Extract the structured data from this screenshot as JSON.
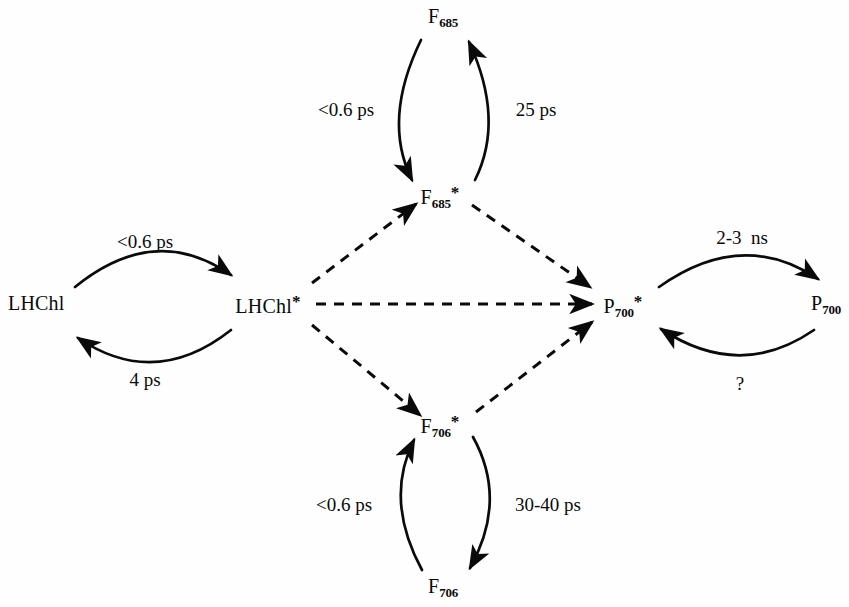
{
  "diagram": {
    "type": "state-transition-diagram",
    "background_color": "#fefefe",
    "line_color": "#0a0a0a",
    "nodes": [
      {
        "id": "lhchl",
        "base": "LHChl",
        "sub": "",
        "star": false,
        "x": 42,
        "y": 305,
        "align": "left"
      },
      {
        "id": "lhchl-star",
        "base": "LHChl",
        "sub": "",
        "star": true,
        "x": 268,
        "y": 305,
        "align": "center"
      },
      {
        "id": "f685",
        "base": "F",
        "sub": "685",
        "star": false,
        "x": 443,
        "y": 18,
        "align": "center"
      },
      {
        "id": "f685-star",
        "base": "F",
        "sub": "685",
        "star": true,
        "x": 440,
        "y": 196,
        "align": "center"
      },
      {
        "id": "f706-star",
        "base": "F",
        "sub": "706",
        "star": true,
        "x": 440,
        "y": 425,
        "align": "center"
      },
      {
        "id": "f706",
        "base": "F",
        "sub": "706",
        "star": false,
        "x": 443,
        "y": 588,
        "align": "center"
      },
      {
        "id": "p700-star",
        "base": "P",
        "sub": "700",
        "star": true,
        "x": 623,
        "y": 305,
        "align": "center"
      },
      {
        "id": "p700",
        "base": "P",
        "sub": "700",
        "star": false,
        "x": 826,
        "y": 305,
        "align": "center"
      }
    ],
    "rate_labels": [
      {
        "id": "rate-lhchl-forward",
        "text": "<0.6 ps",
        "x": 145,
        "y": 243
      },
      {
        "id": "rate-lhchl-reverse",
        "text": "4 ps",
        "x": 145,
        "y": 381
      },
      {
        "id": "rate-f685-down",
        "text": "<0.6 ps",
        "x": 346,
        "y": 111
      },
      {
        "id": "rate-f685-up",
        "text": "25 ps",
        "x": 536,
        "y": 111
      },
      {
        "id": "rate-f706-up",
        "text": "<0.6 ps",
        "x": 344,
        "y": 506
      },
      {
        "id": "rate-f706-down",
        "text": "30-40 ps",
        "x": 548,
        "y": 506
      },
      {
        "id": "rate-p700-decay",
        "text": "2-3  ns",
        "x": 742,
        "y": 239
      },
      {
        "id": "rate-p700-unknown",
        "text": "?",
        "x": 740,
        "y": 385
      }
    ],
    "solid_transitions": [
      {
        "id": "arc-lhchl-forward",
        "from": "LHChl",
        "to": "LHChl*",
        "rate": "<0.6 ps"
      },
      {
        "id": "arc-lhchl-reverse",
        "from": "LHChl*",
        "to": "LHChl",
        "rate": "4 ps"
      },
      {
        "id": "arc-f685-down",
        "from": "F685",
        "to": "F685*",
        "rate": "<0.6 ps"
      },
      {
        "id": "arc-f685-up",
        "from": "F685*",
        "to": "F685",
        "rate": "25 ps"
      },
      {
        "id": "arc-f706-up",
        "from": "F706",
        "to": "F706*",
        "rate": "<0.6 ps"
      },
      {
        "id": "arc-f706-down",
        "from": "F706*",
        "to": "F706",
        "rate": "30-40 ps"
      },
      {
        "id": "arc-p700-decay",
        "from": "P700*",
        "to": "P700",
        "rate": "2-3  ns"
      },
      {
        "id": "arc-p700-return",
        "from": "P700",
        "to": "P700*",
        "rate": "?"
      }
    ],
    "dashed_transitions": [
      {
        "id": "dash-lhchl-to-f685",
        "from": "LHChl*",
        "to": "F685*"
      },
      {
        "id": "dash-f685-to-p700",
        "from": "F685*",
        "to": "P700*"
      },
      {
        "id": "dash-lhchl-to-p700",
        "from": "LHChl*",
        "to": "P700*"
      },
      {
        "id": "dash-lhchl-to-f706",
        "from": "LHChl*",
        "to": "F706*"
      },
      {
        "id": "dash-f706-to-p700",
        "from": "F706*",
        "to": "P700*"
      }
    ]
  }
}
